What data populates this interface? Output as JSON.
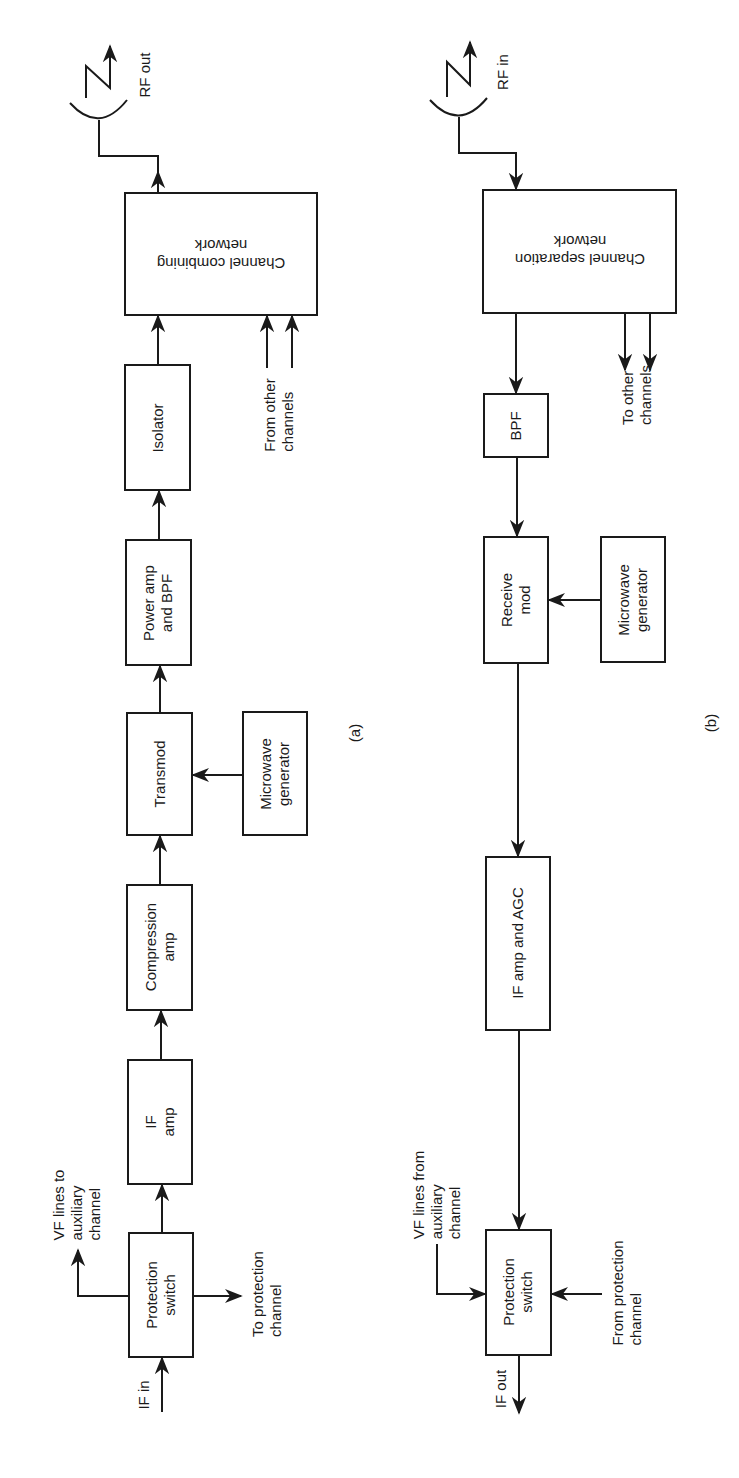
{
  "figure": {
    "panel_a": {
      "caption": "(a)",
      "blocks": {
        "protection_switch": [
          "Protection",
          "switch"
        ],
        "if_amp": [
          "IF",
          "amp"
        ],
        "compression_amp": [
          "Compression",
          "amp"
        ],
        "transmod": [
          "Transmod"
        ],
        "microwave_generator": [
          "Microwave",
          "generator"
        ],
        "power_amp_bpf": [
          "Power amp",
          "and BPF"
        ],
        "isolator": [
          "Isolator"
        ],
        "channel_combining_network": [
          "Channel combining",
          "network"
        ]
      },
      "labels": {
        "if_in": "IF in",
        "vf_lines": [
          "VF lines to",
          "auxiliary",
          "channel"
        ],
        "to_protection": [
          "To protection",
          "channel"
        ],
        "from_other": [
          "From other",
          "channels"
        ],
        "rf_out": "RF out"
      }
    },
    "panel_b": {
      "caption": "(b)",
      "blocks": {
        "channel_separation_network": [
          "Channel separation",
          "network"
        ],
        "bpf": [
          "BPF"
        ],
        "receive_mod": [
          "Receive",
          "mod"
        ],
        "microwave_generator": [
          "Microwave",
          "generator"
        ],
        "if_amp_agc": [
          "IF amp and AGC"
        ],
        "protection_switch": [
          "Protection",
          "switch"
        ]
      },
      "labels": {
        "rf_in": "RF in",
        "to_other": [
          "To other",
          "channels"
        ],
        "vf_lines": [
          "VF lines from",
          "auxiliary",
          "channel"
        ],
        "from_protection": [
          "From protection",
          "channel"
        ],
        "if_out": "IF out"
      }
    }
  }
}
